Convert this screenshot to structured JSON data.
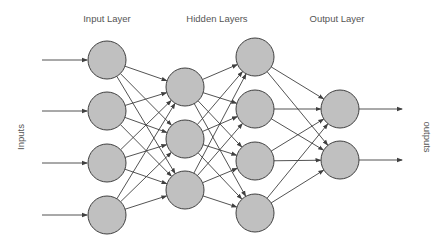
{
  "labels": {
    "input_layer": "Input Layer",
    "hidden_layers": "Hidden Layers",
    "output_layer": "Output Layer",
    "inputs": "Inputs",
    "outputs": "outputs"
  },
  "colors": {
    "node_fill": "#c0c0c0",
    "node_stroke": "#404040",
    "edge": "#404040",
    "text": "#555555"
  },
  "layers": [
    {
      "name": "input",
      "x": 107,
      "ys": [
        60,
        111,
        163,
        215
      ]
    },
    {
      "name": "hidden1",
      "x": 185,
      "ys": [
        87,
        139,
        190
      ]
    },
    {
      "name": "hidden2",
      "x": 255,
      "ys": [
        57,
        109,
        161,
        213
      ]
    },
    {
      "name": "output",
      "x": 340,
      "ys": [
        109,
        160
      ]
    }
  ],
  "node_radius": 19
}
